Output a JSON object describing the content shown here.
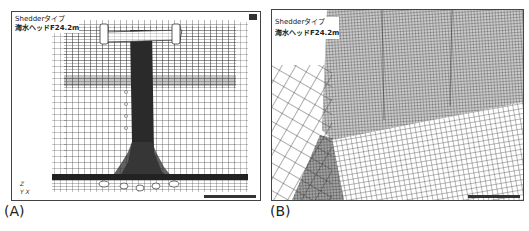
{
  "figure": {
    "panels": [
      {
        "id": "A",
        "caption": "(A)",
        "title_line1": "Shedderタイプ",
        "title_line2": "海水ヘッドF24.2m",
        "axes": {
          "z": "Z",
          "y": "Y",
          "x": "X"
        },
        "view": "front elevation mesh"
      },
      {
        "id": "B",
        "caption": "(B)",
        "title_line1": "Shedderタイプ",
        "title_line2": "海水ヘッドF24.2m",
        "view": "close-up perspective mesh"
      }
    ],
    "colors": {
      "ink": "#222222",
      "mesh": "#333333",
      "frame": "#444444",
      "background": "#ffffff"
    }
  }
}
